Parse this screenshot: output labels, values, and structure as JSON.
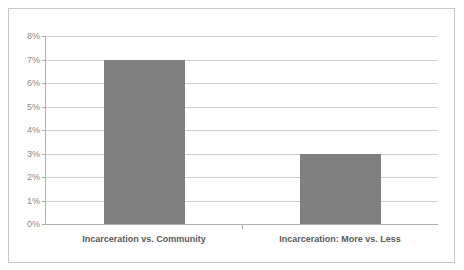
{
  "chart_data": {
    "type": "bar",
    "title": "",
    "subtitle": "",
    "xlabel": "",
    "ylabel": "",
    "categories": [
      "Incarceration vs. Community",
      "Incarceration: More vs. Less"
    ],
    "values": [
      7,
      3
    ],
    "value_labels": [
      "7%",
      "3%"
    ],
    "ylim": [
      0,
      8
    ],
    "ytick_values": [
      0,
      1,
      2,
      3,
      4,
      5,
      6,
      7,
      8
    ],
    "ytick_labels": [
      "0%",
      "1%",
      "2%",
      "3%",
      "4%",
      "5%",
      "6%",
      "7%",
      "8%"
    ],
    "grid": true,
    "legend": false,
    "legend_position": "none",
    "series": [
      {
        "name": "",
        "values": [
          7,
          3
        ],
        "color": "#808080"
      }
    ],
    "colors": {
      "bar": "#808080",
      "gridline": "#cfcfcf",
      "axis": "#b0b0b0",
      "frame_border": "#c8c8c8",
      "tick_label": "#8a8a8a",
      "category_label": "#5a5a5a",
      "background": "#ffffff"
    }
  }
}
